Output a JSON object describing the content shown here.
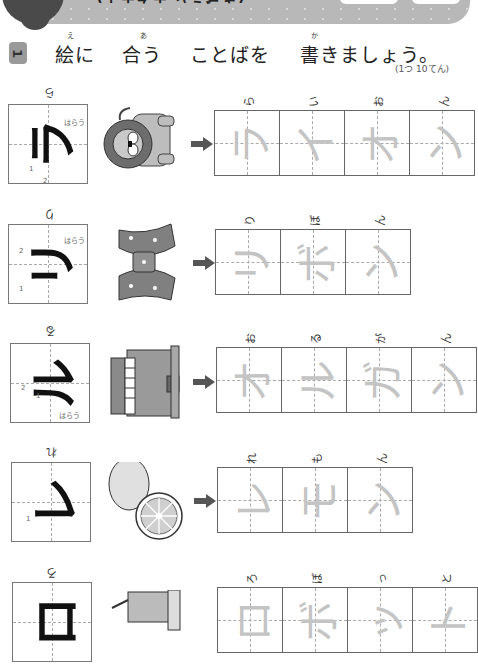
{
  "header": {
    "title": "(きごうと カタカナ)",
    "box_count": 2
  },
  "instruction": {
    "number": "1",
    "parts": [
      {
        "text": "絵に",
        "ruby": "え"
      },
      {
        "text": "合う",
        "ruby": "あ"
      },
      {
        "text": "ことばを",
        "ruby": ""
      },
      {
        "text": "書きましょう。",
        "ruby": "か"
      }
    ],
    "score": "(1つ 10てん)"
  },
  "rows": [
    {
      "id": "lion",
      "model": {
        "char": "ラ",
        "reading": "ら",
        "notes": [
          "1",
          "2",
          "はらう"
        ]
      },
      "picture": "lion",
      "word": "ライオン",
      "cells": [
        {
          "char": "ラ",
          "reading": "ら"
        },
        {
          "char": "イ",
          "reading": "い"
        },
        {
          "char": "オ",
          "reading": "お"
        },
        {
          "char": "ン",
          "reading": "ん"
        }
      ]
    },
    {
      "id": "ribbon",
      "model": {
        "char": "リ",
        "reading": "り",
        "notes": [
          "1",
          "2",
          "はらう"
        ]
      },
      "picture": "ribbon",
      "word": "リボン",
      "cells": [
        {
          "char": "リ",
          "reading": "り"
        },
        {
          "char": "ボ",
          "reading": "ぼ"
        },
        {
          "char": "ン",
          "reading": "ん"
        }
      ]
    },
    {
      "id": "organ",
      "model": {
        "char": "ル",
        "reading": "る",
        "notes": [
          "1",
          "2",
          "はらう"
        ]
      },
      "picture": "organ",
      "word": "オルガン",
      "cells": [
        {
          "char": "オ",
          "reading": "お"
        },
        {
          "char": "ル",
          "reading": "る"
        },
        {
          "char": "ガ",
          "reading": "が"
        },
        {
          "char": "ン",
          "reading": "ん"
        }
      ]
    },
    {
      "id": "lemon",
      "model": {
        "char": "レ",
        "reading": "れ",
        "notes": [
          "1"
        ]
      },
      "picture": "lemon",
      "word": "レモン",
      "cells": [
        {
          "char": "レ",
          "reading": "れ"
        },
        {
          "char": "モ",
          "reading": "も"
        },
        {
          "char": "ン",
          "reading": "ん"
        }
      ]
    },
    {
      "id": "robot",
      "model": {
        "char": "ロ",
        "reading": "ろ",
        "notes": []
      },
      "picture": "robot",
      "word": "ロボット",
      "cells": [
        {
          "char": "ロ",
          "reading": "ろ"
        },
        {
          "char": "ボ",
          "reading": "ぼ"
        },
        {
          "char": "ッ",
          "reading": "っ"
        },
        {
          "char": "ト",
          "reading": "と"
        }
      ]
    }
  ],
  "colors": {
    "header_band": "#b8b8b8",
    "header_blob": "#4a4a4a",
    "badge": "#9a9a9a",
    "trace": "#c4c4c4",
    "arrow": "#555555"
  }
}
